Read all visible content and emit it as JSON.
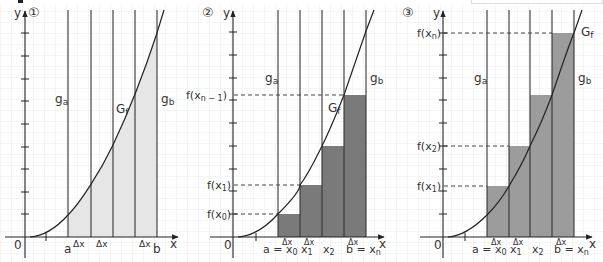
{
  "figure": {
    "colors": {
      "axis": "#333333",
      "grid": "#ebebeb",
      "curve": "#222222",
      "panel1_fill": "#e8e8e8",
      "panel2_fill": "#7a7a7a",
      "panel3_fill": "#9c9c9c",
      "dashed": "#444444"
    },
    "panels": [
      {
        "number": "①",
        "y_axis_label": "y",
        "x_axis_label": "x",
        "origin_label": "0",
        "curve_label": "Gf",
        "left_line_label": "ga",
        "right_line_label": "gb",
        "bottom_labels": {
          "a": "a",
          "b": "b",
          "dx": "Δx"
        },
        "description": "Area between graph of f, x-axis, and lines x=a and x=b divided into strips of width Δx"
      },
      {
        "number": "②",
        "y_axis_label": "y",
        "x_axis_label": "x",
        "origin_label": "0",
        "curve_label": "Gf",
        "left_line_label": "ga",
        "right_line_label": "gb",
        "y_labels": [
          "f(x0)",
          "f(x1)",
          "f(xn−1)"
        ],
        "x_labels": [
          "a = x0",
          "x1",
          "x2",
          "b = xn"
        ],
        "dx_label": "Δx",
        "description": "Lower sum: rectangles with height of left endpoint"
      },
      {
        "number": "③",
        "y_axis_label": "y",
        "x_axis_label": "x",
        "origin_label": "0",
        "curve_label": "Gf",
        "left_line_label": "ga",
        "right_line_label": "gb",
        "y_labels": [
          "f(x1)",
          "f(x2)",
          "f(xn)"
        ],
        "x_labels": [
          "a = x0",
          "x1",
          "x2",
          "b = xn"
        ],
        "dx_label": "Δx",
        "description": "Upper sum: rectangles with height of right endpoint"
      }
    ]
  }
}
